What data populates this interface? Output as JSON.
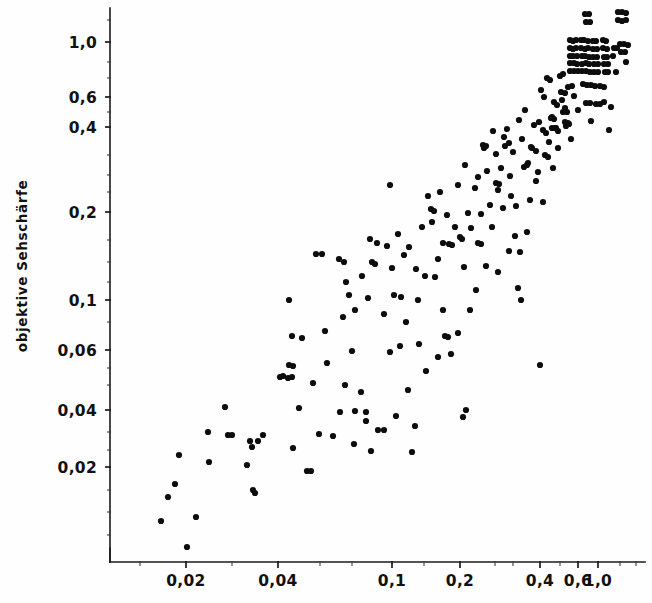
{
  "chart_data": {
    "type": "scatter",
    "title": "",
    "subtitle": "",
    "xlabel": "",
    "ylabel": "objektive Sehschärfe",
    "scale": "log-log",
    "grid": false,
    "legend": null,
    "annotations": [],
    "axes": {
      "x": {
        "tick_labels": [
          "0,02",
          "0,04",
          "0,1",
          "0,2",
          "0,4",
          "0,6",
          "1,0"
        ],
        "tick_values": [
          0.02,
          0.04,
          0.1,
          0.2,
          0.4,
          0.6,
          1.0
        ],
        "tick_px": [
          186,
          278,
          392,
          460,
          540,
          578,
          598
        ],
        "axis_start_px": 110,
        "axis_end_px": 645,
        "axis_y_px": 562,
        "xlim": [
          0.009,
          1.45
        ]
      },
      "y": {
        "tick_labels": [
          "1,0",
          "0,6",
          "0,4",
          "0,2",
          "0,1",
          "0,06",
          "0,04",
          "0,02"
        ],
        "tick_values": [
          1.0,
          0.6,
          0.4,
          0.2,
          0.1,
          0.06,
          0.04,
          0.02
        ],
        "tick_px": [
          42,
          97,
          127,
          212,
          300,
          350,
          410,
          467
        ],
        "axis_x_px": 110,
        "axis_top_px": 8,
        "axis_bottom_px": 562,
        "ylim": [
          0.0075,
          1.3
        ]
      }
    },
    "point_radius_px": 3.1,
    "points_px": [
      [
        168,
        497
      ],
      [
        161,
        521
      ],
      [
        175,
        484
      ],
      [
        179,
        455
      ],
      [
        225,
        407
      ],
      [
        228,
        435
      ],
      [
        232,
        435
      ],
      [
        250,
        441
      ],
      [
        252,
        447
      ],
      [
        258,
        441
      ],
      [
        253,
        490
      ],
      [
        255,
        493
      ],
      [
        280,
        377
      ],
      [
        283,
        376
      ],
      [
        288,
        378
      ],
      [
        292,
        377
      ],
      [
        289,
        300
      ],
      [
        292,
        336
      ],
      [
        319,
        434
      ],
      [
        325,
        331
      ],
      [
        316,
        254
      ],
      [
        322,
        254
      ],
      [
        343,
        317
      ],
      [
        346,
        282
      ],
      [
        349,
        295
      ],
      [
        352,
        351
      ],
      [
        355,
        310
      ],
      [
        362,
        276
      ],
      [
        339,
        259
      ],
      [
        344,
        262
      ],
      [
        368,
        298
      ],
      [
        372,
        262
      ],
      [
        375,
        264
      ],
      [
        370,
        239
      ],
      [
        377,
        243
      ],
      [
        384,
        314
      ],
      [
        387,
        246
      ],
      [
        390,
        185
      ],
      [
        392,
        268
      ],
      [
        394,
        295
      ],
      [
        398,
        234
      ],
      [
        401,
        297
      ],
      [
        404,
        255
      ],
      [
        409,
        247
      ],
      [
        412,
        452
      ],
      [
        415,
        426
      ],
      [
        418,
        300
      ],
      [
        422,
        227
      ],
      [
        425,
        276
      ],
      [
        428,
        196
      ],
      [
        432,
        222
      ],
      [
        435,
        277
      ],
      [
        438,
        259
      ],
      [
        440,
        192
      ],
      [
        443,
        243
      ],
      [
        447,
        215
      ],
      [
        449,
        244
      ],
      [
        452,
        245
      ],
      [
        455,
        227
      ],
      [
        458,
        185
      ],
      [
        460,
        237
      ],
      [
        462,
        239
      ],
      [
        465,
        165
      ],
      [
        468,
        213
      ],
      [
        471,
        228
      ],
      [
        463,
        417
      ],
      [
        466,
        410
      ],
      [
        475,
        188
      ],
      [
        478,
        177
      ],
      [
        481,
        214
      ],
      [
        484,
        148
      ],
      [
        487,
        171
      ],
      [
        490,
        205
      ],
      [
        493,
        131
      ],
      [
        496,
        154
      ],
      [
        498,
        190
      ],
      [
        501,
        168
      ],
      [
        504,
        137
      ],
      [
        507,
        129
      ],
      [
        510,
        176
      ],
      [
        513,
        152
      ],
      [
        511,
        196
      ],
      [
        516,
        206
      ],
      [
        519,
        120
      ],
      [
        522,
        139
      ],
      [
        518,
        288
      ],
      [
        521,
        300
      ],
      [
        525,
        110
      ],
      [
        528,
        163
      ],
      [
        531,
        147
      ],
      [
        534,
        125
      ],
      [
        536,
        181
      ],
      [
        539,
        122
      ],
      [
        541,
        90
      ],
      [
        544,
        97
      ],
      [
        543,
        130
      ],
      [
        546,
        133
      ],
      [
        549,
        142
      ],
      [
        552,
        117
      ],
      [
        547,
        78
      ],
      [
        550,
        80
      ],
      [
        554,
        102
      ],
      [
        557,
        105
      ],
      [
        555,
        128
      ],
      [
        558,
        131
      ],
      [
        560,
        76
      ],
      [
        563,
        74
      ],
      [
        562,
        100
      ],
      [
        565,
        108
      ],
      [
        566,
        126
      ],
      [
        569,
        124
      ],
      [
        570,
        40
      ],
      [
        573,
        41
      ],
      [
        576,
        40
      ],
      [
        570,
        48
      ],
      [
        573,
        49
      ],
      [
        576,
        48
      ],
      [
        570,
        56
      ],
      [
        573,
        56
      ],
      [
        577,
        56
      ],
      [
        570,
        63
      ],
      [
        574,
        63
      ],
      [
        577,
        64
      ],
      [
        570,
        71
      ],
      [
        574,
        71
      ],
      [
        578,
        71
      ],
      [
        581,
        40
      ],
      [
        584,
        40
      ],
      [
        588,
        41
      ],
      [
        581,
        48
      ],
      [
        585,
        49
      ],
      [
        588,
        48
      ],
      [
        582,
        56
      ],
      [
        585,
        56
      ],
      [
        589,
        57
      ],
      [
        582,
        64
      ],
      [
        586,
        63
      ],
      [
        589,
        64
      ],
      [
        582,
        71
      ],
      [
        586,
        71
      ],
      [
        590,
        72
      ],
      [
        593,
        41
      ],
      [
        596,
        41
      ],
      [
        593,
        49
      ],
      [
        597,
        49
      ],
      [
        593,
        57
      ],
      [
        597,
        57
      ],
      [
        594,
        64
      ],
      [
        598,
        64
      ],
      [
        594,
        72
      ],
      [
        598,
        72
      ],
      [
        603,
        40
      ],
      [
        606,
        41
      ],
      [
        603,
        48
      ],
      [
        607,
        49
      ],
      [
        604,
        57
      ],
      [
        607,
        57
      ],
      [
        604,
        64
      ],
      [
        608,
        64
      ],
      [
        605,
        72
      ],
      [
        608,
        72
      ],
      [
        585,
        14
      ],
      [
        589,
        14
      ],
      [
        586,
        22
      ],
      [
        590,
        22
      ],
      [
        618,
        12
      ],
      [
        622,
        12
      ],
      [
        626,
        13
      ],
      [
        618,
        20
      ],
      [
        622,
        21
      ],
      [
        626,
        20
      ],
      [
        620,
        44
      ],
      [
        624,
        44
      ],
      [
        628,
        45
      ],
      [
        621,
        52
      ],
      [
        625,
        52
      ],
      [
        626,
        62
      ],
      [
        583,
        84
      ],
      [
        587,
        85
      ],
      [
        591,
        85
      ],
      [
        595,
        86
      ],
      [
        586,
        103
      ],
      [
        590,
        103
      ],
      [
        596,
        104
      ],
      [
        600,
        104
      ],
      [
        604,
        102
      ],
      [
        561,
        92
      ],
      [
        565,
        93
      ],
      [
        563,
        112
      ],
      [
        567,
        112
      ],
      [
        565,
        122
      ],
      [
        568,
        123
      ],
      [
        551,
        118
      ],
      [
        554,
        119
      ],
      [
        552,
        128
      ],
      [
        556,
        128
      ],
      [
        568,
        87
      ],
      [
        572,
        86
      ],
      [
        574,
        96
      ],
      [
        532,
        148
      ],
      [
        536,
        151
      ],
      [
        524,
        167
      ],
      [
        527,
        165
      ],
      [
        609,
        130
      ],
      [
        600,
        86
      ],
      [
        604,
        87
      ],
      [
        505,
        146
      ],
      [
        509,
        143
      ],
      [
        496,
        183
      ],
      [
        499,
        184
      ],
      [
        483,
        145
      ],
      [
        486,
        146
      ],
      [
        431,
        209
      ],
      [
        434,
        211
      ],
      [
        445,
        336
      ],
      [
        448,
        337
      ],
      [
        451,
        354
      ],
      [
        478,
        243
      ],
      [
        481,
        244
      ],
      [
        470,
        310
      ],
      [
        492,
        227
      ],
      [
        503,
        208
      ],
      [
        515,
        236
      ],
      [
        520,
        252
      ],
      [
        545,
        155
      ],
      [
        548,
        157
      ],
      [
        538,
        172
      ],
      [
        553,
        168
      ],
      [
        530,
        200
      ],
      [
        543,
        202
      ],
      [
        558,
        148
      ],
      [
        571,
        139
      ],
      [
        578,
        110
      ],
      [
        591,
        121
      ],
      [
        611,
        107
      ],
      [
        614,
        48
      ],
      [
        617,
        48
      ],
      [
        613,
        56
      ],
      [
        616,
        72
      ],
      [
        540,
        365
      ],
      [
        419,
        344
      ],
      [
        408,
        390
      ],
      [
        361,
        392
      ],
      [
        371,
        451
      ],
      [
        366,
        412
      ],
      [
        366,
        421
      ],
      [
        333,
        436
      ],
      [
        293,
        448
      ],
      [
        307,
        471
      ],
      [
        311,
        471
      ],
      [
        247,
        465
      ],
      [
        209,
        462
      ],
      [
        196,
        517
      ],
      [
        187,
        547
      ],
      [
        208,
        432
      ],
      [
        263,
        435
      ],
      [
        299,
        408
      ],
      [
        345,
        385
      ],
      [
        302,
        338
      ],
      [
        327,
        363
      ],
      [
        340,
        412
      ],
      [
        354,
        444
      ],
      [
        378,
        430
      ],
      [
        384,
        430
      ],
      [
        396,
        416
      ],
      [
        355,
        411
      ],
      [
        313,
        383
      ],
      [
        289,
        365
      ],
      [
        293,
        366
      ],
      [
        426,
        371
      ],
      [
        438,
        357
      ],
      [
        458,
        333
      ],
      [
        443,
        310
      ],
      [
        406,
        322
      ],
      [
        390,
        352
      ],
      [
        476,
        290
      ],
      [
        486,
        266
      ],
      [
        498,
        272
      ],
      [
        464,
        267
      ],
      [
        509,
        251
      ],
      [
        527,
        232
      ],
      [
        416,
        269
      ],
      [
        400,
        346
      ]
    ]
  }
}
